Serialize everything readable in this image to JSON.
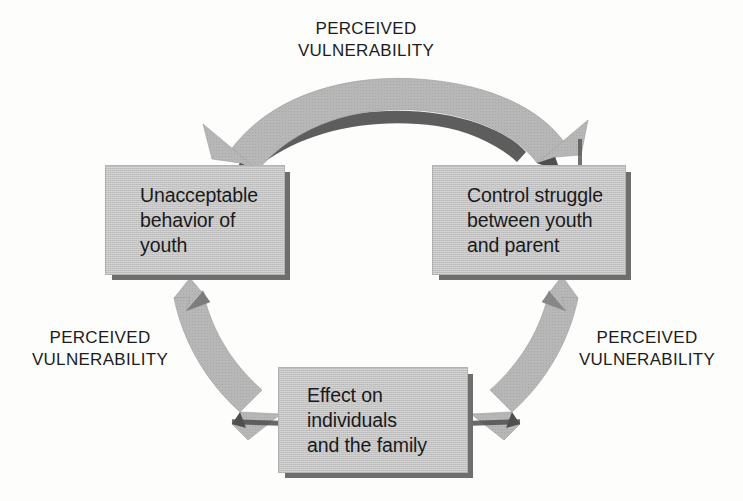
{
  "diagram": {
    "type": "cycle-diagram",
    "colors": {
      "box_fill": "#c3c3c3",
      "box_shadow": "#6e6e6e",
      "arrow_fill": "#b7b7b7",
      "arrow_shadow": "#5f5f5f",
      "text": "#1a1a1a",
      "background": "#fdfdfc"
    },
    "nodes": [
      {
        "id": "unacceptable-behavior",
        "text": "Unacceptable\nbehavior of\nyouth",
        "position": "left"
      },
      {
        "id": "control-struggle",
        "text": "Control struggle\nbetween youth\nand parent",
        "position": "right"
      },
      {
        "id": "effect-family",
        "text": "Effect on\nindividuals\nand the family",
        "position": "bottom"
      }
    ],
    "connectors": [
      {
        "id": "top-arc",
        "label": "PERCEIVED\nVULNERABILITY",
        "from": "unacceptable-behavior",
        "to": "control-struggle",
        "style": "double-headed-curved-arrow",
        "position": "top"
      },
      {
        "id": "left-arc",
        "label": "PERCEIVED\nVULNERABILITY",
        "from": "effect-family",
        "to": "unacceptable-behavior",
        "style": "double-headed-curved-arrow",
        "position": "left"
      },
      {
        "id": "right-arc",
        "label": "PERCEIVED\nVULNERABILITY",
        "from": "effect-family",
        "to": "control-struggle",
        "style": "double-headed-curved-arrow",
        "position": "right"
      }
    ]
  }
}
